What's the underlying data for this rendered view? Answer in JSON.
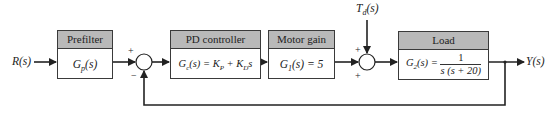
{
  "diagram": {
    "type": "block-diagram",
    "input_label": "R(s)",
    "output_label": "Y(s)",
    "disturbance_label": "T_d(s)",
    "disturbance_display": "T",
    "disturbance_sub": "d",
    "disturbance_tail": "(s)",
    "blocks": [
      {
        "id": "prefilter",
        "title": "Prefilter",
        "expr": "G_p(s)",
        "expr_main": "G",
        "expr_sub": "p",
        "expr_tail": "(s)"
      },
      {
        "id": "pd-controller",
        "title": "PD controller",
        "expr": "G_c(s) = K_P + K_D s",
        "expr_main": "G",
        "expr_sub": "c",
        "expr_mid": "(s) = K",
        "expr_sub2": "P",
        "expr_mid2": " + K",
        "expr_sub3": "D",
        "expr_tail": "s"
      },
      {
        "id": "motor-gain",
        "title": "Motor gain",
        "expr": "G_1(s) = 5",
        "expr_main": "G",
        "expr_sub": "1",
        "expr_tail": "(s) = 5"
      },
      {
        "id": "load",
        "title": "Load",
        "expr": "G_2(s) = 1 / (s(s + 20))",
        "expr_main": "G",
        "expr_sub": "2",
        "expr_tail": "(s) = ",
        "num": "1",
        "den": "s (s + 20)"
      }
    ],
    "summing_junctions": [
      {
        "id": "sum1",
        "signs": {
          "top": "+",
          "bottom": "−"
        }
      },
      {
        "id": "sum2",
        "signs": {
          "top": "+",
          "bottom": "+"
        }
      }
    ],
    "feedback": "unity negative feedback from Y(s) to sum1"
  }
}
